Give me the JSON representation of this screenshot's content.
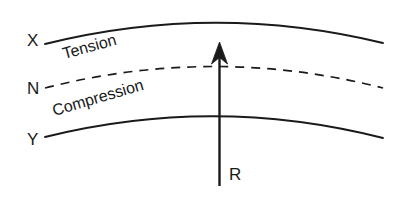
{
  "diagram": {
    "background_color": "#ffffff",
    "stroke_color": "#1a1a1a",
    "labels": {
      "top_fiber": "X",
      "neutral_axis": "N",
      "bottom_fiber": "Y",
      "reaction_force": "R",
      "upper_zone": "Tension",
      "lower_zone": "Compression"
    },
    "curves": [
      {
        "name": "top-fiber-curve",
        "label": "X",
        "style": "solid",
        "path": "M 45 44 Q 214 2 383 43"
      },
      {
        "name": "neutral-axis-curve",
        "label": "N",
        "style": "dashed",
        "dash_pattern": "9 7",
        "path": "M 45 88 Q 214 45 383 88"
      },
      {
        "name": "bottom-fiber-curve",
        "label": "Y",
        "style": "solid",
        "path": "M 45 137 Q 214 95 383 138"
      }
    ],
    "arrow": {
      "name": "reaction-force-arrow",
      "label": "R",
      "direction": "up",
      "shaft_x": 219,
      "tail_y": 186,
      "tip_y": 42,
      "head_width": 15,
      "head_length": 21
    }
  }
}
